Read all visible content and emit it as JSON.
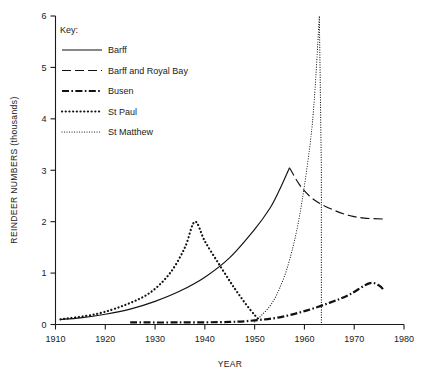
{
  "chart_data": {
    "type": "line",
    "title": "",
    "xlabel": "YEAR",
    "ylabel": "REINDEER NUMBERS (thousands)",
    "xlim": [
      1910,
      1980
    ],
    "ylim": [
      0,
      6
    ],
    "xticks": [
      1910,
      1920,
      1930,
      1940,
      1950,
      1960,
      1970,
      1980
    ],
    "yticks": [
      0,
      1,
      2,
      3,
      4,
      5,
      6
    ],
    "grid": false,
    "legend_position": "upper-left-inside",
    "legend_title": "Key:",
    "series": [
      {
        "name": "Barff",
        "style": "solid",
        "points": [
          [
            1911,
            0.1
          ],
          [
            1915,
            0.13
          ],
          [
            1920,
            0.2
          ],
          [
            1925,
            0.3
          ],
          [
            1930,
            0.45
          ],
          [
            1935,
            0.65
          ],
          [
            1940,
            0.92
          ],
          [
            1945,
            1.3
          ],
          [
            1950,
            1.85
          ],
          [
            1953,
            2.25
          ],
          [
            1955,
            2.62
          ],
          [
            1957,
            3.05
          ]
        ]
      },
      {
        "name": "Barff and Royal Bay",
        "style": "dashed",
        "points": [
          [
            1957,
            3.05
          ],
          [
            1959,
            2.72
          ],
          [
            1961,
            2.5
          ],
          [
            1963,
            2.36
          ],
          [
            1966,
            2.22
          ],
          [
            1969,
            2.12
          ],
          [
            1972,
            2.07
          ],
          [
            1976,
            2.05
          ]
        ]
      },
      {
        "name": "Busen",
        "style": "dash-dot",
        "points": [
          [
            1925,
            0.04
          ],
          [
            1935,
            0.04
          ],
          [
            1945,
            0.05
          ],
          [
            1950,
            0.08
          ],
          [
            1955,
            0.14
          ],
          [
            1960,
            0.26
          ],
          [
            1965,
            0.42
          ],
          [
            1969,
            0.58
          ],
          [
            1973,
            0.8
          ],
          [
            1975,
            0.76
          ],
          [
            1976,
            0.66
          ]
        ]
      },
      {
        "name": "St Paul",
        "style": "dotted-thick",
        "points": [
          [
            1911,
            0.1
          ],
          [
            1918,
            0.2
          ],
          [
            1924,
            0.38
          ],
          [
            1929,
            0.62
          ],
          [
            1933,
            1.0
          ],
          [
            1936,
            1.5
          ],
          [
            1938,
            2.0
          ],
          [
            1940,
            1.62
          ],
          [
            1943,
            1.15
          ],
          [
            1946,
            0.7
          ],
          [
            1949,
            0.3
          ],
          [
            1951,
            0.08
          ]
        ]
      },
      {
        "name": "St Matthew",
        "style": "dotted-fine",
        "points": [
          [
            1950,
            0.05
          ],
          [
            1953,
            0.35
          ],
          [
            1955,
            0.7
          ],
          [
            1957,
            1.25
          ],
          [
            1959,
            2.1
          ],
          [
            1961,
            3.4
          ],
          [
            1962,
            4.4
          ],
          [
            1963,
            6.0
          ],
          [
            1963.4,
            3.0
          ],
          [
            1963.4,
            0.0
          ]
        ]
      }
    ],
    "annotations": [
      {
        "text": "St Matthew collapses vertically from peak 6.0 to 0 at 1963",
        "type": "crash"
      }
    ]
  },
  "legend": {
    "title": "Key:",
    "items": [
      {
        "label": "Barff",
        "style": "solid"
      },
      {
        "label": "Barff and Royal Bay",
        "style": "dashed"
      },
      {
        "label": "Busen",
        "style": "dash-dot"
      },
      {
        "label": "St Paul",
        "style": "dotted-thick"
      },
      {
        "label": "St Matthew",
        "style": "dotted-fine"
      }
    ]
  },
  "axes": {
    "y_title": "REINDEER NUMBERS (thousands)",
    "x_title": "YEAR",
    "y_labels": [
      "0",
      "1",
      "2",
      "3",
      "4",
      "5",
      "6"
    ],
    "x_labels": [
      "1910",
      "1920",
      "1930",
      "1940",
      "1950",
      "1960",
      "1970",
      "1980"
    ]
  },
  "colors": {
    "ink": "#111111",
    "background": "#ffffff"
  }
}
